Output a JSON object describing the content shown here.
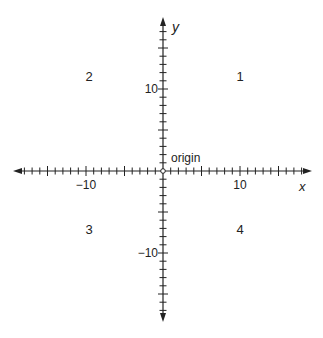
{
  "diagram": {
    "origin_px": [
      163,
      171
    ],
    "unit_px_x": 7.7,
    "unit_px_y": 8.2,
    "axis_color": "#222222",
    "x_axis": {
      "label": "x",
      "min": -19,
      "max": 19,
      "major_ticks_labeled": [
        -10,
        10
      ]
    },
    "y_axis": {
      "label": "y",
      "min": -18,
      "max": 18,
      "major_ticks_labeled": [
        10,
        -10
      ]
    },
    "tick_labels": {
      "x_neg10": "−10",
      "x_pos10": "10",
      "y_pos10": "10",
      "y_neg10": "−10"
    },
    "origin_label": "origin",
    "quadrants": [
      {
        "number": "1",
        "x": 240,
        "y": 77
      },
      {
        "number": "2",
        "x": 89,
        "y": 77
      },
      {
        "number": "3",
        "x": 89,
        "y": 230
      },
      {
        "number": "4",
        "x": 240,
        "y": 230
      }
    ]
  }
}
